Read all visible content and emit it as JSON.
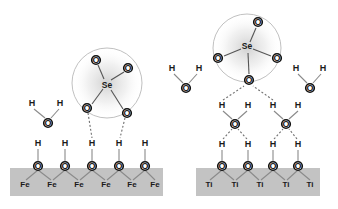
{
  "figure": {
    "type": "molecular-adsorption-schematic",
    "panels": [
      {
        "id": "left",
        "substrate_label": "Fe",
        "mechanism": "inner-sphere / direct hydrogen bonding to singly-hydrated Fe-oxide surface"
      },
      {
        "id": "right",
        "substrate_label": "Ti",
        "mechanism": "outer-sphere bonding through an intervening water layer on Ti-oxide surface"
      }
    ]
  },
  "colors": {
    "slab_fill": "#c3c3c3",
    "atom_outline": "#111111",
    "atom_fill": "#ffffff",
    "bond": "#8a8a8a",
    "hydrogen_bond": "#6e6e6e",
    "solvation_sphere": "#b9b9b9",
    "text": "#1a1a1a",
    "background": "#ffffff"
  },
  "atoms": {
    "oxygen": "O",
    "hydrogen": "H",
    "selenium": "Se",
    "iron": "Fe",
    "titanium": "Ti"
  },
  "left_panel": {
    "slab": {
      "x": 10,
      "y": 168,
      "width": 153,
      "height": 28,
      "label": "Fe"
    },
    "metal_labels": [
      {
        "text": "Fe",
        "x": 25,
        "y": 184
      },
      {
        "text": "Fe",
        "x": 52,
        "y": 184
      },
      {
        "text": "Fe",
        "x": 79,
        "y": 184
      },
      {
        "text": "Fe",
        "x": 106,
        "y": 184
      },
      {
        "text": "Fe",
        "x": 132,
        "y": 184
      },
      {
        "text": "Fe",
        "x": 155,
        "y": 184
      }
    ],
    "surface_oxygens": [
      {
        "text": "O",
        "x": 38,
        "y": 166
      },
      {
        "text": "O",
        "x": 65,
        "y": 166
      },
      {
        "text": "O",
        "x": 92,
        "y": 166
      },
      {
        "text": "O",
        "x": 119,
        "y": 166
      },
      {
        "text": "O",
        "x": 145,
        "y": 166
      }
    ],
    "surface_hydrogens": [
      {
        "text": "H",
        "x": 38,
        "y": 143
      },
      {
        "text": "H",
        "x": 65,
        "y": 143
      },
      {
        "text": "H",
        "x": 92,
        "y": 143
      },
      {
        "text": "H",
        "x": 119,
        "y": 143
      },
      {
        "text": "H",
        "x": 145,
        "y": 143
      }
    ],
    "water": {
      "oxygen": {
        "text": "O",
        "x": 48,
        "y": 123
      },
      "hydrogens": [
        {
          "text": "H",
          "x": 32,
          "y": 103
        },
        {
          "text": "H",
          "x": 60,
          "y": 103
        }
      ]
    },
    "selenium_cluster": {
      "sphere": {
        "cx": 107,
        "cy": 83,
        "r": 35
      },
      "center": {
        "text": "Se",
        "x": 107,
        "y": 85
      },
      "oxygens": [
        {
          "text": "O",
          "x": 96,
          "y": 60
        },
        {
          "text": "O",
          "x": 128,
          "y": 68
        },
        {
          "text": "O",
          "x": 87,
          "y": 108
        },
        {
          "text": "O",
          "x": 127,
          "y": 113
        }
      ]
    }
  },
  "right_panel": {
    "slab": {
      "x": 196,
      "y": 168,
      "width": 124,
      "height": 28,
      "label": "Ti"
    },
    "metal_labels": [
      {
        "text": "Ti",
        "x": 209,
        "y": 184
      },
      {
        "text": "Ti",
        "x": 235,
        "y": 184
      },
      {
        "text": "Ti",
        "x": 260,
        "y": 184
      },
      {
        "text": "Ti",
        "x": 286,
        "y": 184
      },
      {
        "text": "Ti",
        "x": 310,
        "y": 184
      }
    ],
    "surface_oxygens": [
      {
        "text": "O",
        "x": 222,
        "y": 166
      },
      {
        "text": "O",
        "x": 248,
        "y": 166
      },
      {
        "text": "O",
        "x": 273,
        "y": 166
      },
      {
        "text": "O",
        "x": 298,
        "y": 166
      }
    ],
    "surface_hydrogens": [
      {
        "text": "H",
        "x": 222,
        "y": 144
      },
      {
        "text": "H",
        "x": 248,
        "y": 144
      },
      {
        "text": "H",
        "x": 273,
        "y": 144
      },
      {
        "text": "H",
        "x": 298,
        "y": 144
      }
    ],
    "bridging_waters": [
      {
        "oxygen": {
          "text": "O",
          "x": 235,
          "y": 124
        },
        "hydrogens": [
          {
            "text": "H",
            "x": 222,
            "y": 105
          },
          {
            "text": "H",
            "x": 248,
            "y": 105
          }
        ]
      },
      {
        "oxygen": {
          "text": "O",
          "x": 286,
          "y": 124
        },
        "hydrogens": [
          {
            "text": "H",
            "x": 273,
            "y": 105
          },
          {
            "text": "H",
            "x": 298,
            "y": 105
          }
        ]
      }
    ],
    "free_waters": [
      {
        "oxygen": {
          "text": "O",
          "x": 186,
          "y": 88
        },
        "hydrogens": [
          {
            "text": "H",
            "x": 172,
            "y": 68
          },
          {
            "text": "H",
            "x": 199,
            "y": 68
          }
        ]
      },
      {
        "oxygen": {
          "text": "O",
          "x": 310,
          "y": 88
        },
        "hydrogens": [
          {
            "text": "H",
            "x": 296,
            "y": 68
          },
          {
            "text": "H",
            "x": 323,
            "y": 68
          }
        ]
      }
    ],
    "selenium_cluster": {
      "sphere": {
        "cx": 247,
        "cy": 48,
        "r": 34
      },
      "center": {
        "text": "Se",
        "x": 247,
        "y": 46
      },
      "oxygens": [
        {
          "text": "O",
          "x": 258,
          "y": 22
        },
        {
          "text": "O",
          "x": 218,
          "y": 58
        },
        {
          "text": "O",
          "x": 277,
          "y": 58
        },
        {
          "text": "O",
          "x": 249,
          "y": 80
        }
      ]
    }
  }
}
